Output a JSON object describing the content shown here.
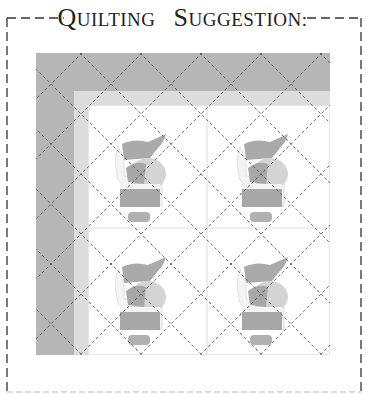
{
  "heading": {
    "words": [
      {
        "cap": "Q",
        "rest": "UILTING"
      },
      {
        "cap": "S",
        "rest": "UGGESTION:"
      }
    ],
    "full_text": "Quilting Suggestion:"
  },
  "quilt": {
    "description": "Quilt layout with 2x2 grid of santa appliqué blocks, wide left and top borders, and diagonal crosshatch quilting lines",
    "blocks": [
      {
        "row": 1,
        "col": 1,
        "motif": "santa"
      },
      {
        "row": 1,
        "col": 2,
        "motif": "santa"
      },
      {
        "row": 2,
        "col": 1,
        "motif": "santa"
      },
      {
        "row": 2,
        "col": 2,
        "motif": "santa"
      }
    ],
    "colors": {
      "outer_border": "#b4b4b4",
      "inner_border": "#dcdcdc",
      "block_background": "#ffffff",
      "seam": "#e2e2e2",
      "santa_dark": "#a9a9a9",
      "santa_light": "#d2d2d2",
      "quilting_line": "#555555",
      "frame_dash": "#333333"
    }
  }
}
